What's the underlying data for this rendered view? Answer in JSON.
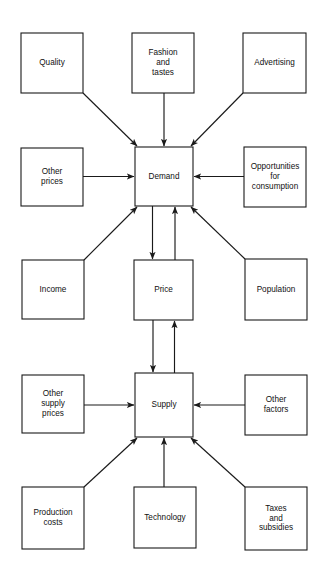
{
  "diagram": {
    "background_color": "#ffffff",
    "line_color": "#1a1a1a",
    "box_fill": "#ffffff",
    "text_color": "#111111",
    "nodes": [
      {
        "id": "quality",
        "label": "Quality",
        "lines": [
          "Quality"
        ],
        "x": 21,
        "y": 33,
        "w": 62,
        "h": 60
      },
      {
        "id": "fashion",
        "label": "Fashion and tastes",
        "lines": [
          "Fashion",
          "and",
          "tastes"
        ],
        "x": 132,
        "y": 33,
        "w": 62,
        "h": 60
      },
      {
        "id": "advertising",
        "label": "Advertising",
        "lines": [
          "Advertising"
        ],
        "x": 243,
        "y": 33,
        "w": 63,
        "h": 60
      },
      {
        "id": "other-prices",
        "label": "Other prices",
        "lines": [
          "Other",
          "prices"
        ],
        "x": 21,
        "y": 148,
        "w": 62,
        "h": 58
      },
      {
        "id": "demand",
        "label": "Demand",
        "lines": [
          "Demand"
        ],
        "x": 135,
        "y": 147,
        "w": 58,
        "h": 59
      },
      {
        "id": "opportunities",
        "label": "Opportunities for consumption",
        "lines": [
          "Opportunities",
          "for",
          "consumption"
        ],
        "x": 244,
        "y": 147,
        "w": 62,
        "h": 60
      },
      {
        "id": "income",
        "label": "Income",
        "lines": [
          "Income"
        ],
        "x": 22,
        "y": 260,
        "w": 62,
        "h": 59
      },
      {
        "id": "price",
        "label": "Price",
        "lines": [
          "Price"
        ],
        "x": 134,
        "y": 260,
        "w": 59,
        "h": 60
      },
      {
        "id": "population",
        "label": "Population",
        "lines": [
          "Population"
        ],
        "x": 245,
        "y": 259,
        "w": 62,
        "h": 61
      },
      {
        "id": "other-supply-prices",
        "label": "Other supply prices",
        "lines": [
          "Other",
          "supply",
          "prices"
        ],
        "x": 22,
        "y": 375,
        "w": 62,
        "h": 58
      },
      {
        "id": "supply",
        "label": "Supply",
        "lines": [
          "Supply"
        ],
        "x": 135,
        "y": 373,
        "w": 58,
        "h": 64
      },
      {
        "id": "other-factors",
        "label": "Other factors",
        "lines": [
          "Other",
          "factors"
        ],
        "x": 245,
        "y": 375,
        "w": 62,
        "h": 60
      },
      {
        "id": "production-costs",
        "label": "Production costs",
        "lines": [
          "Production",
          "costs"
        ],
        "x": 22,
        "y": 487,
        "w": 62,
        "h": 62
      },
      {
        "id": "technology",
        "label": "Technology",
        "lines": [
          "Technology"
        ],
        "x": 134,
        "y": 487,
        "w": 62,
        "h": 61
      },
      {
        "id": "taxes",
        "label": "Taxes and subsidies",
        "lines": [
          "Taxes",
          "and",
          "subsidies"
        ],
        "x": 245,
        "y": 487,
        "w": 62,
        "h": 63
      }
    ],
    "edges": [
      {
        "id": "quality-to-demand",
        "from": "quality",
        "to": "demand",
        "kind": "diagonal",
        "direction": "forward"
      },
      {
        "id": "fashion-to-demand",
        "from": "fashion",
        "to": "demand",
        "kind": "vertical",
        "direction": "forward"
      },
      {
        "id": "advertising-to-demand",
        "from": "advertising",
        "to": "demand",
        "kind": "diagonal",
        "direction": "forward"
      },
      {
        "id": "other-prices-to-demand",
        "from": "other-prices",
        "to": "demand",
        "kind": "horizontal",
        "direction": "forward"
      },
      {
        "id": "opportunities-to-demand",
        "from": "opportunities",
        "to": "demand",
        "kind": "horizontal",
        "direction": "forward"
      },
      {
        "id": "income-to-demand",
        "from": "income",
        "to": "demand",
        "kind": "diagonal",
        "direction": "forward"
      },
      {
        "id": "population-to-demand",
        "from": "population",
        "to": "demand",
        "kind": "diagonal",
        "direction": "forward"
      },
      {
        "id": "demand-price-down",
        "from": "demand",
        "to": "price",
        "kind": "vertical",
        "direction": "forward"
      },
      {
        "id": "price-demand-up",
        "from": "price",
        "to": "demand",
        "kind": "vertical",
        "direction": "forward"
      },
      {
        "id": "price-supply-down",
        "from": "price",
        "to": "supply",
        "kind": "vertical",
        "direction": "forward"
      },
      {
        "id": "supply-price-up",
        "from": "supply",
        "to": "price",
        "kind": "vertical",
        "direction": "forward"
      },
      {
        "id": "other-supply-prices-to-supply",
        "from": "other-supply-prices",
        "to": "supply",
        "kind": "horizontal",
        "direction": "forward"
      },
      {
        "id": "other-factors-to-supply",
        "from": "other-factors",
        "to": "supply",
        "kind": "horizontal",
        "direction": "forward"
      },
      {
        "id": "production-costs-to-supply",
        "from": "production-costs",
        "to": "supply",
        "kind": "diagonal",
        "direction": "forward"
      },
      {
        "id": "technology-to-supply",
        "from": "technology",
        "to": "supply",
        "kind": "vertical",
        "direction": "forward"
      },
      {
        "id": "taxes-to-supply",
        "from": "taxes",
        "to": "supply",
        "kind": "diagonal",
        "direction": "forward"
      }
    ]
  }
}
